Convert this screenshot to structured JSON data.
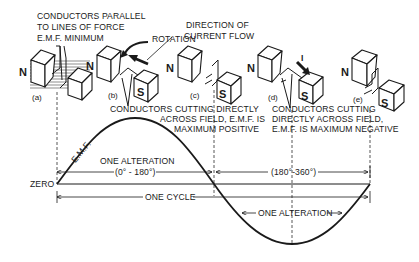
{
  "diagram": {
    "labels": {
      "parallel": [
        "CONDUCTORS PARALLEL",
        "TO LINES OF FORCE",
        "E.M.F. MINIMUM"
      ],
      "rotation": "ROTATION",
      "direction": [
        "DIRECTION OF",
        "CURRENT FLOW"
      ],
      "positive": [
        "CONDUCTORS CUTTING DIRECTLY",
        "ACROSS FIELD, E.M.F. IS",
        "MAXIMUM POSITIVE"
      ],
      "negative": [
        "CONDUCTORS CUTTING",
        "DIRECTLY ACROSS FIELD,",
        "E.M.F. IS MAXIMUM NEGATIVE"
      ],
      "emf": "E.M.F.",
      "zero": "ZERO",
      "alteration1": "ONE ALTERATION",
      "range1": "(0° - 180°)",
      "range2": "(180°-360°)",
      "one_cycle": "ONE CYCLE",
      "alteration2": "ONE ALTERATION",
      "current_symbol": "I"
    },
    "stages": [
      {
        "tag": "(a)",
        "north": "N",
        "south": "S"
      },
      {
        "tag": "(b)",
        "north": "N",
        "south": "S"
      },
      {
        "tag": "(c)",
        "north": "N",
        "south": "S"
      },
      {
        "tag": "(d)",
        "north": "N",
        "south": "S"
      },
      {
        "tag": "(e)",
        "north": "N",
        "south": "S"
      }
    ]
  }
}
